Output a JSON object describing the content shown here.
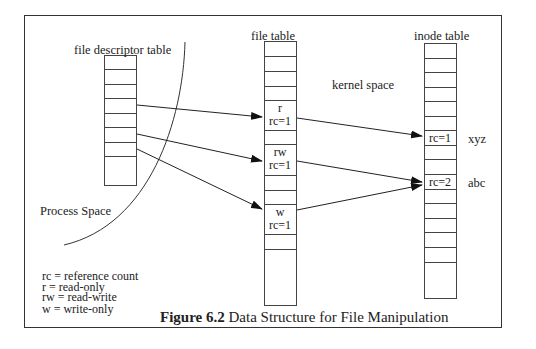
{
  "diagram": {
    "labels": {
      "fd_table": "file descriptor table",
      "file_table": "file table",
      "inode_table": "inode table",
      "kernel_space": "kernel space",
      "process_space": "Process Space"
    },
    "file_table_entries": [
      {
        "mode": "r",
        "rc": "rc=1"
      },
      {
        "mode": "rw",
        "rc": "rc=1"
      },
      {
        "mode": "w",
        "rc": "rc=1"
      }
    ],
    "inode_entries": [
      {
        "rc": "rc=1",
        "name": "xyz"
      },
      {
        "rc": "rc=2",
        "name": "abc"
      }
    ],
    "legend": [
      "rc = reference count",
      "r = read-only",
      "rw = read-write",
      "w = write-only"
    ],
    "caption": {
      "number": "Figure 6.2",
      "title": " Data Structure for File Manipulation"
    }
  }
}
